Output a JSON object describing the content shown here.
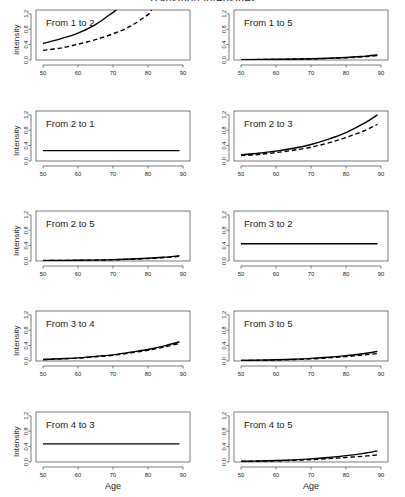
{
  "figure": {
    "title_clipped": "Transition intensities",
    "xlabel": "Age",
    "ylabel": "Intensity",
    "x_ticks": [
      "50",
      "60",
      "70",
      "80",
      "90"
    ],
    "y_ticks": [
      "0.0",
      "0.4",
      "0.8",
      "1.2"
    ],
    "line_styles": [
      "solid",
      "dashed"
    ],
    "background": "#ffffff",
    "line_color": "#000000",
    "axis_color": "#595959"
  },
  "panels": [
    {
      "label": "From 1 to 2",
      "row": 0,
      "col": 0
    },
    {
      "label": "From 1 to 5",
      "row": 0,
      "col": 1
    },
    {
      "label": "From 2 to 1",
      "row": 1,
      "col": 0
    },
    {
      "label": "From 2 to 3",
      "row": 1,
      "col": 1
    },
    {
      "label": "From 2 to 5",
      "row": 2,
      "col": 0
    },
    {
      "label": "From 3 to 2",
      "row": 2,
      "col": 1
    },
    {
      "label": "From 3 to 4",
      "row": 3,
      "col": 0
    },
    {
      "label": "From 3 to 5",
      "row": 3,
      "col": 1
    },
    {
      "label": "From 4 to 3",
      "row": 4,
      "col": 0
    },
    {
      "label": "From 4 to 5",
      "row": 4,
      "col": 1
    }
  ],
  "chart_data": [
    {
      "type": "line",
      "title": "From 1 to 2",
      "xlabel": "Age",
      "ylabel": "Intensity",
      "xlim": [
        48,
        92
      ],
      "ylim": [
        0.0,
        1.3
      ],
      "xticks": [
        50,
        60,
        70,
        80,
        90
      ],
      "yticks": [
        0.0,
        0.4,
        0.8,
        1.2
      ],
      "grid": false,
      "legend": "none",
      "series": [
        {
          "name": "solid",
          "style": "solid",
          "x": [
            50,
            55,
            60,
            65,
            70,
            71
          ],
          "y": [
            0.43,
            0.55,
            0.7,
            0.92,
            1.24,
            1.31
          ]
        },
        {
          "name": "dashed",
          "style": "dashed",
          "x": [
            50,
            55,
            60,
            65,
            70,
            75,
            80,
            81
          ],
          "y": [
            0.25,
            0.31,
            0.41,
            0.53,
            0.68,
            0.88,
            1.18,
            1.3
          ]
        }
      ]
    },
    {
      "type": "line",
      "title": "From 1 to 5",
      "xlabel": "Age",
      "ylabel": "Intensity",
      "xlim": [
        48,
        92
      ],
      "ylim": [
        0.0,
        1.3
      ],
      "xticks": [
        50,
        60,
        70,
        80,
        90
      ],
      "yticks": [
        0.0,
        0.4,
        0.8,
        1.2
      ],
      "grid": false,
      "legend": "none",
      "series": [
        {
          "name": "solid",
          "style": "solid",
          "x": [
            50,
            60,
            70,
            80,
            85,
            89
          ],
          "y": [
            0.01,
            0.018,
            0.032,
            0.065,
            0.095,
            0.13
          ]
        },
        {
          "name": "dashed",
          "style": "dashed",
          "x": [
            50,
            60,
            70,
            80,
            85,
            89
          ],
          "y": [
            0.008,
            0.015,
            0.028,
            0.058,
            0.085,
            0.118
          ]
        }
      ]
    },
    {
      "type": "line",
      "title": "From 2 to 1",
      "xlabel": "Age",
      "ylabel": "Intensity",
      "xlim": [
        48,
        92
      ],
      "ylim": [
        0.0,
        1.3
      ],
      "xticks": [
        50,
        60,
        70,
        80,
        90
      ],
      "yticks": [
        0.0,
        0.4,
        0.8,
        1.2
      ],
      "grid": false,
      "legend": "none",
      "series": [
        {
          "name": "solid",
          "style": "solid",
          "x": [
            50,
            60,
            70,
            80,
            89
          ],
          "y": [
            0.27,
            0.27,
            0.27,
            0.27,
            0.27
          ]
        }
      ]
    },
    {
      "type": "line",
      "title": "From 2 to 3",
      "xlabel": "Age",
      "ylabel": "Intensity",
      "xlim": [
        48,
        92
      ],
      "ylim": [
        0.0,
        1.3
      ],
      "xticks": [
        50,
        60,
        70,
        80,
        90
      ],
      "yticks": [
        0.0,
        0.4,
        0.8,
        1.2
      ],
      "grid": false,
      "legend": "none",
      "series": [
        {
          "name": "solid",
          "style": "solid",
          "x": [
            50,
            55,
            60,
            65,
            70,
            75,
            80,
            85,
            89
          ],
          "y": [
            0.16,
            0.2,
            0.26,
            0.33,
            0.43,
            0.57,
            0.74,
            0.97,
            1.2
          ]
        },
        {
          "name": "dashed",
          "style": "dashed",
          "x": [
            50,
            55,
            60,
            65,
            70,
            75,
            80,
            85,
            89
          ],
          "y": [
            0.14,
            0.17,
            0.22,
            0.28,
            0.36,
            0.47,
            0.61,
            0.78,
            0.95
          ]
        }
      ]
    },
    {
      "type": "line",
      "title": "From 2 to 5",
      "xlabel": "Age",
      "ylabel": "Intensity",
      "xlim": [
        48,
        92
      ],
      "ylim": [
        0.0,
        1.3
      ],
      "xticks": [
        50,
        60,
        70,
        80,
        90
      ],
      "yticks": [
        0.0,
        0.4,
        0.8,
        1.2
      ],
      "grid": false,
      "legend": "none",
      "series": [
        {
          "name": "solid",
          "style": "solid",
          "x": [
            50,
            60,
            70,
            80,
            85,
            89
          ],
          "y": [
            0.012,
            0.02,
            0.036,
            0.07,
            0.1,
            0.135
          ]
        },
        {
          "name": "dashed",
          "style": "dashed",
          "x": [
            50,
            60,
            70,
            80,
            85,
            89
          ],
          "y": [
            0.01,
            0.018,
            0.032,
            0.064,
            0.092,
            0.125
          ]
        }
      ]
    },
    {
      "type": "line",
      "title": "From 3 to 2",
      "xlabel": "Age",
      "ylabel": "Intensity",
      "xlim": [
        48,
        92
      ],
      "ylim": [
        0.0,
        1.3
      ],
      "xticks": [
        50,
        60,
        70,
        80,
        90
      ],
      "yticks": [
        0.0,
        0.4,
        0.8,
        1.2
      ],
      "grid": false,
      "legend": "none",
      "series": [
        {
          "name": "solid",
          "style": "solid",
          "x": [
            50,
            60,
            70,
            80,
            89
          ],
          "y": [
            0.45,
            0.45,
            0.45,
            0.45,
            0.45
          ]
        }
      ]
    },
    {
      "type": "line",
      "title": "From 3 to 4",
      "xlabel": "Age",
      "ylabel": "Intensity",
      "xlim": [
        48,
        92
      ],
      "ylim": [
        0.0,
        1.3
      ],
      "xticks": [
        50,
        60,
        70,
        80,
        90
      ],
      "yticks": [
        0.0,
        0.4,
        0.8,
        1.2
      ],
      "grid": false,
      "legend": "none",
      "series": [
        {
          "name": "solid",
          "style": "solid",
          "x": [
            50,
            55,
            60,
            65,
            70,
            75,
            80,
            85,
            89
          ],
          "y": [
            0.04,
            0.06,
            0.08,
            0.12,
            0.16,
            0.23,
            0.3,
            0.4,
            0.5
          ]
        },
        {
          "name": "dashed",
          "style": "dashed",
          "x": [
            50,
            55,
            60,
            65,
            70,
            75,
            80,
            85,
            89
          ],
          "y": [
            0.035,
            0.055,
            0.075,
            0.11,
            0.15,
            0.21,
            0.28,
            0.37,
            0.46
          ]
        }
      ]
    },
    {
      "type": "line",
      "title": "From 3 to 5",
      "xlabel": "Age",
      "ylabel": "Intensity",
      "xlim": [
        48,
        92
      ],
      "ylim": [
        0.0,
        1.3
      ],
      "xticks": [
        50,
        60,
        70,
        80,
        90
      ],
      "yticks": [
        0.0,
        0.4,
        0.8,
        1.2
      ],
      "grid": false,
      "legend": "none",
      "series": [
        {
          "name": "solid",
          "style": "solid",
          "x": [
            50,
            55,
            60,
            65,
            70,
            75,
            80,
            85,
            89
          ],
          "y": [
            0.015,
            0.022,
            0.032,
            0.046,
            0.068,
            0.098,
            0.14,
            0.19,
            0.25
          ]
        },
        {
          "name": "dashed",
          "style": "dashed",
          "x": [
            50,
            55,
            60,
            65,
            70,
            75,
            80,
            85,
            89
          ],
          "y": [
            0.012,
            0.018,
            0.026,
            0.038,
            0.056,
            0.082,
            0.115,
            0.155,
            0.195
          ]
        }
      ]
    },
    {
      "type": "line",
      "title": "From 4 to 3",
      "xlabel": "Age",
      "ylabel": "Intensity",
      "xlim": [
        48,
        92
      ],
      "ylim": [
        0.0,
        1.3
      ],
      "xticks": [
        50,
        60,
        70,
        80,
        90
      ],
      "yticks": [
        0.0,
        0.4,
        0.8,
        1.2
      ],
      "grid": false,
      "legend": "none",
      "series": [
        {
          "name": "solid",
          "style": "solid",
          "x": [
            50,
            60,
            70,
            80,
            89
          ],
          "y": [
            0.47,
            0.47,
            0.47,
            0.47,
            0.47
          ]
        }
      ]
    },
    {
      "type": "line",
      "title": "From 4 to 5",
      "xlabel": "Age",
      "ylabel": "Intensity",
      "xlim": [
        48,
        92
      ],
      "ylim": [
        0.0,
        1.3
      ],
      "xticks": [
        50,
        60,
        70,
        80,
        90
      ],
      "yticks": [
        0.0,
        0.4,
        0.8,
        1.2
      ],
      "grid": false,
      "legend": "none",
      "series": [
        {
          "name": "solid",
          "style": "solid",
          "x": [
            50,
            55,
            60,
            65,
            70,
            75,
            80,
            85,
            89
          ],
          "y": [
            0.018,
            0.026,
            0.038,
            0.055,
            0.08,
            0.118,
            0.165,
            0.225,
            0.29
          ]
        },
        {
          "name": "dashed",
          "style": "dashed",
          "x": [
            50,
            55,
            60,
            65,
            70,
            75,
            80,
            85,
            89
          ],
          "y": [
            0.015,
            0.021,
            0.03,
            0.043,
            0.062,
            0.088,
            0.118,
            0.15,
            0.185
          ]
        }
      ]
    }
  ]
}
